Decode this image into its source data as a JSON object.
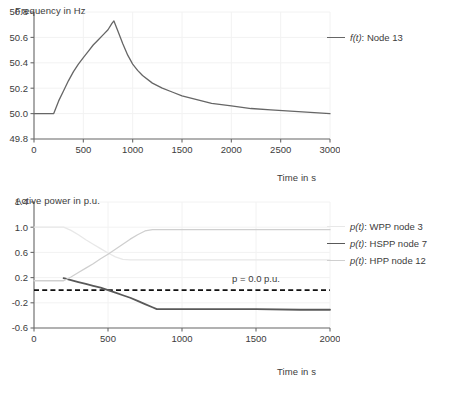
{
  "figure": {
    "background": "#ffffff",
    "text_color": "#3c3c3c"
  },
  "panels": [
    {
      "id": "frequency",
      "ylabel": "Frequency in Hz",
      "xlabel": "Time in s"
    },
    {
      "id": "active-power",
      "ylabel": "Active power in p.u.",
      "xlabel": "Time in s"
    }
  ],
  "legend_top": [
    {
      "math": "f(t)",
      "text": ": Node 13",
      "color": "#666666",
      "width": 1.4
    }
  ],
  "legend_bottom": [
    {
      "math": "p(t)",
      "text": ": WPP node 3",
      "color": "#e8e8e8",
      "width": 1.4
    },
    {
      "math": "p(t)",
      "text": ": HSPP node 7",
      "color": "#595959",
      "width": 1.8
    },
    {
      "math": "p(t)",
      "text": ": HPP node 12",
      "color": "#cfcfcf",
      "width": 1.4
    }
  ],
  "chart_data": [
    {
      "type": "line",
      "id": "frequency",
      "title": "",
      "xlabel": "Time in s",
      "ylabel": "Frequency in Hz",
      "xlim": [
        0,
        3000
      ],
      "ylim": [
        49.8,
        50.8
      ],
      "xticks": [
        0,
        500,
        1000,
        1500,
        2000,
        2500,
        3000
      ],
      "yticks": [
        49.8,
        50.0,
        50.2,
        50.4,
        50.6,
        50.8
      ],
      "grid": "faint vertical and horizontal gridlines at ticks",
      "legend_position": "right-outside-top",
      "series": [
        {
          "name": "f(t): Node 13",
          "color": "#666666",
          "x": [
            0,
            100,
            200,
            210,
            250,
            300,
            350,
            400,
            450,
            500,
            550,
            600,
            650,
            700,
            750,
            790,
            810,
            850,
            900,
            950,
            1000,
            1050,
            1100,
            1200,
            1300,
            1400,
            1500,
            1600,
            1700,
            1800,
            1900,
            2000,
            2200,
            2400,
            2600,
            2800,
            3000
          ],
          "y": [
            50.0,
            50.0,
            50.0,
            50.02,
            50.1,
            50.18,
            50.26,
            50.33,
            50.39,
            50.44,
            50.49,
            50.54,
            50.58,
            50.62,
            50.66,
            50.71,
            50.73,
            50.65,
            50.55,
            50.46,
            50.39,
            50.34,
            50.3,
            50.24,
            50.2,
            50.17,
            50.14,
            50.12,
            50.1,
            50.08,
            50.07,
            50.06,
            50.04,
            50.03,
            50.02,
            50.01,
            50.0
          ]
        }
      ]
    },
    {
      "type": "line",
      "id": "active-power",
      "title": "",
      "xlabel": "Time in s",
      "ylabel": "Active power in p.u.",
      "xlim": [
        0,
        2000
      ],
      "ylim": [
        -0.6,
        1.4
      ],
      "xticks": [
        0,
        500,
        1000,
        1500,
        2000
      ],
      "yticks": [
        -0.6,
        -0.2,
        0.2,
        0.6,
        1.0,
        1.4
      ],
      "grid": "faint vertical and horizontal gridlines at ticks",
      "legend_position": "right-outside-top",
      "annotations": [
        {
          "text": "p = 0.0 p.u.",
          "x": 1500,
          "y": 0.13,
          "line_y": 0.0,
          "style": "dashed",
          "color": "#111111"
        }
      ],
      "series": [
        {
          "name": "p(t): WPP node 3",
          "color": "#e8e8e8",
          "x": [
            0,
            200,
            250,
            300,
            350,
            400,
            450,
            500,
            550,
            600,
            650,
            800,
            1000,
            1500,
            2000
          ],
          "y": [
            1.0,
            1.0,
            0.95,
            0.88,
            0.8,
            0.73,
            0.66,
            0.59,
            0.53,
            0.49,
            0.48,
            0.48,
            0.48,
            0.48,
            0.48
          ]
        },
        {
          "name": "p(t): HSPP node 7",
          "color": "#595959",
          "x": [
            200,
            250,
            300,
            350,
            400,
            450,
            500,
            550,
            600,
            650,
            700,
            750,
            800,
            830,
            1000,
            1200,
            1500,
            1800,
            2000
          ],
          "y": [
            0.19,
            0.16,
            0.13,
            0.1,
            0.07,
            0.04,
            0.0,
            -0.04,
            -0.08,
            -0.12,
            -0.17,
            -0.22,
            -0.27,
            -0.3,
            -0.3,
            -0.3,
            -0.3,
            -0.31,
            -0.31
          ]
        },
        {
          "name": "p(t): HPP node 12",
          "color": "#cfcfcf",
          "x": [
            0,
            200,
            250,
            300,
            350,
            400,
            450,
            500,
            550,
            600,
            650,
            700,
            750,
            800,
            1000,
            1500,
            2000
          ],
          "y": [
            0.15,
            0.15,
            0.21,
            0.28,
            0.35,
            0.42,
            0.5,
            0.57,
            0.65,
            0.73,
            0.81,
            0.88,
            0.94,
            0.96,
            0.96,
            0.96,
            0.96
          ]
        }
      ]
    }
  ]
}
